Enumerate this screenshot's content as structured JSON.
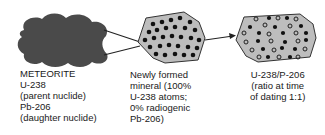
{
  "diagram": {
    "stages": [
      {
        "id": "meteorite",
        "shape": "cloud",
        "fill": "#4a4a4a",
        "lines": [
          "METEORITE",
          "U-238",
          "(parent nuclide)",
          "Pb-206",
          "(daughter nuclide)"
        ]
      },
      {
        "id": "newly-formed-mineral",
        "shape": "octagon",
        "fill": "#bdbdbd",
        "dots": "filled (U-238)",
        "lines": [
          "Newly formed",
          "mineral (100%",
          "U-238 atoms;",
          "0% radiogenic",
          "Pb-206)"
        ]
      },
      {
        "id": "mineral-at-dating",
        "shape": "octagon",
        "fill": "#bdbdbd",
        "dots": "filled (U-238) and hollow (Pb-206), ratio 1:1",
        "lines": [
          "U-238/P-206",
          "(ratio at time",
          "of dating 1:1)"
        ]
      }
    ],
    "arrows": [
      {
        "from": "meteorite",
        "to": "newly-formed-mineral",
        "style": "converging lines"
      },
      {
        "from": "newly-formed-mineral",
        "to": "mineral-at-dating",
        "style": "arrow"
      }
    ]
  }
}
